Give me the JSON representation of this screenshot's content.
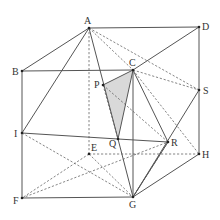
{
  "diagram": {
    "title": "",
    "points": {
      "A": {
        "x": 89,
        "y": 28,
        "label": "A",
        "lx": 84,
        "ly": 24
      },
      "D": {
        "x": 199,
        "y": 27,
        "label": "D",
        "lx": 202,
        "ly": 30
      },
      "B": {
        "x": 22,
        "y": 71,
        "label": "B",
        "lx": 12,
        "ly": 75
      },
      "C": {
        "x": 133,
        "y": 70,
        "label": "C",
        "lx": 129,
        "ly": 66
      },
      "P": {
        "x": 103,
        "y": 85,
        "label": "P",
        "lx": 94,
        "ly": 88
      },
      "S": {
        "x": 199,
        "y": 90,
        "label": "S",
        "lx": 203,
        "ly": 94
      },
      "I": {
        "x": 22,
        "y": 133,
        "label": "I",
        "lx": 14,
        "ly": 137
      },
      "Q": {
        "x": 118,
        "y": 139,
        "label": "Q",
        "lx": 109,
        "ly": 147
      },
      "R": {
        "x": 168,
        "y": 142,
        "label": "R",
        "lx": 171,
        "ly": 146
      },
      "E": {
        "x": 89,
        "y": 154,
        "label": "E",
        "lx": 91,
        "ly": 151
      },
      "H": {
        "x": 199,
        "y": 154,
        "label": "H",
        "lx": 202,
        "ly": 158
      },
      "F": {
        "x": 22,
        "y": 198,
        "label": "F",
        "lx": 13,
        "ly": 204
      },
      "G": {
        "x": 133,
        "y": 197,
        "label": "G",
        "lx": 129,
        "ly": 208
      }
    },
    "shaded_face": [
      "P",
      "C",
      "Q"
    ],
    "shaded_color": "#d9d9d9",
    "solid_edges": [
      [
        "A",
        "D"
      ],
      [
        "D",
        "S"
      ],
      [
        "S",
        "H"
      ],
      [
        "A",
        "B"
      ],
      [
        "B",
        "C"
      ],
      [
        "B",
        "I"
      ],
      [
        "I",
        "F"
      ],
      [
        "F",
        "G"
      ],
      [
        "G",
        "H"
      ],
      [
        "D",
        "C"
      ],
      [
        "A",
        "I"
      ],
      [
        "A",
        "Q"
      ],
      [
        "C",
        "Q"
      ],
      [
        "C",
        "G"
      ],
      [
        "C",
        "R"
      ],
      [
        "Q",
        "R"
      ],
      [
        "I",
        "Q"
      ],
      [
        "G",
        "R"
      ],
      [
        "G",
        "S"
      ],
      [
        "P",
        "C"
      ],
      [
        "Q",
        "G"
      ]
    ],
    "dashed_edges": [
      [
        "A",
        "E"
      ],
      [
        "A",
        "C"
      ],
      [
        "A",
        "S"
      ],
      [
        "C",
        "S"
      ],
      [
        "P",
        "R"
      ],
      [
        "P",
        "Q"
      ],
      [
        "I",
        "G"
      ],
      [
        "E",
        "F"
      ],
      [
        "F",
        "R"
      ],
      [
        "E",
        "G"
      ],
      [
        "E",
        "H"
      ],
      [
        "R",
        "G"
      ],
      [
        "C",
        "H"
      ]
    ],
    "labeled_points": [
      "A",
      "B",
      "C",
      "D",
      "E",
      "F",
      "G",
      "H",
      "I",
      "P",
      "Q",
      "R",
      "S"
    ]
  }
}
